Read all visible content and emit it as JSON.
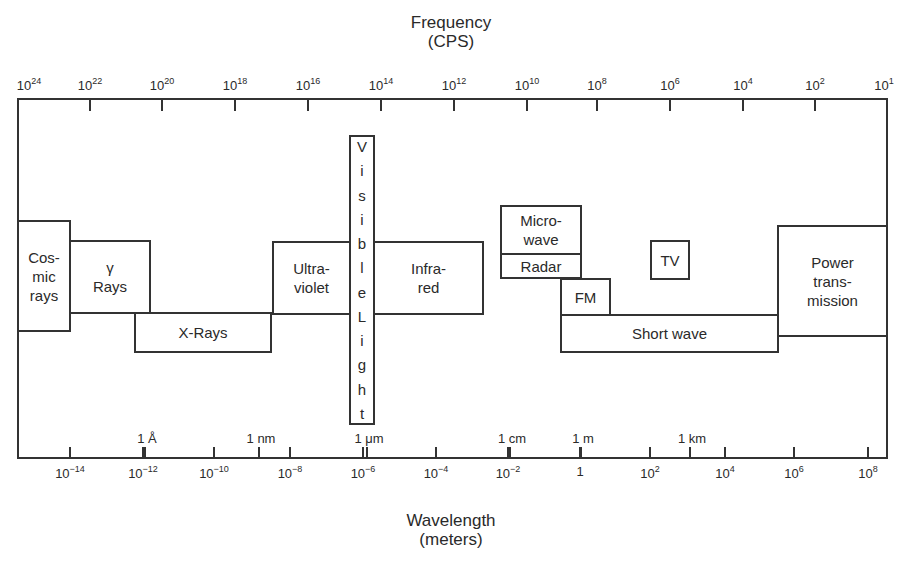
{
  "top_axis": {
    "title": "Frequency",
    "unit": "(CPS)",
    "ticks": [
      {
        "base": "10",
        "exp": "24",
        "x": 29
      },
      {
        "base": "10",
        "exp": "22",
        "x": 90
      },
      {
        "base": "10",
        "exp": "20",
        "x": 162
      },
      {
        "base": "10",
        "exp": "18",
        "x": 235
      },
      {
        "base": "10",
        "exp": "16",
        "x": 308
      },
      {
        "base": "10",
        "exp": "14",
        "x": 381
      },
      {
        "base": "10",
        "exp": "12",
        "x": 454
      },
      {
        "base": "10",
        "exp": "10",
        "x": 527
      },
      {
        "base": "10",
        "exp": "8",
        "x": 597
      },
      {
        "base": "10",
        "exp": "6",
        "x": 670
      },
      {
        "base": "10",
        "exp": "4",
        "x": 743
      },
      {
        "base": "10",
        "exp": "2",
        "x": 815
      },
      {
        "base": "10",
        "exp": "1",
        "x": 884
      }
    ]
  },
  "bottom_axis": {
    "title": "Wavelength",
    "unit": "(meters)",
    "ticks": [
      {
        "base": "10",
        "exp": "−14",
        "x": 70
      },
      {
        "base": "10",
        "exp": "−12",
        "x": 143
      },
      {
        "base": "10",
        "exp": "−10",
        "x": 214
      },
      {
        "base": "10",
        "exp": "−8",
        "x": 290
      },
      {
        "base": "10",
        "exp": "−6",
        "x": 363
      },
      {
        "base": "10",
        "exp": "−4",
        "x": 436
      },
      {
        "base": "10",
        "exp": "−2",
        "x": 508
      },
      {
        "base": "1",
        "exp": "",
        "x": 580
      },
      {
        "base": "10",
        "exp": "2",
        "x": 650
      },
      {
        "base": "10",
        "exp": "4",
        "x": 725
      },
      {
        "base": "10",
        "exp": "6",
        "x": 794
      },
      {
        "base": "10",
        "exp": "8",
        "x": 868
      }
    ],
    "unit_markers": [
      {
        "label": "1 Å",
        "x": 147
      },
      {
        "label": "1 nm",
        "x": 261
      },
      {
        "label": "1 μm",
        "x": 369
      },
      {
        "label": "1 cm",
        "x": 512
      },
      {
        "label": "1 m",
        "x": 583
      },
      {
        "label": "1 km",
        "x": 692
      }
    ]
  },
  "bands": [
    {
      "id": "cosmic-rays",
      "label": "Cos-\nmic\nrays",
      "x": 17,
      "y": 220,
      "w": 54,
      "h": 112
    },
    {
      "id": "gamma-rays",
      "label": "γ\nRays",
      "x": 69,
      "y": 240,
      "w": 82,
      "h": 74
    },
    {
      "id": "x-rays",
      "label": "X-Rays",
      "x": 134,
      "y": 312,
      "w": 138,
      "h": 41
    },
    {
      "id": "ultraviolet",
      "label": "Ultra-\nviolet",
      "x": 272,
      "y": 241,
      "w": 79,
      "h": 74
    },
    {
      "id": "infrared",
      "label": "Infra-\nred",
      "x": 373,
      "y": 241,
      "w": 111,
      "h": 74
    },
    {
      "id": "microwave",
      "label": "Micro-\nwave",
      "x": 500,
      "y": 205,
      "w": 82,
      "h": 50
    },
    {
      "id": "radar",
      "label": "Radar",
      "x": 500,
      "y": 253,
      "w": 82,
      "h": 26
    },
    {
      "id": "fm",
      "label": "FM",
      "x": 560,
      "y": 278,
      "w": 51,
      "h": 38
    },
    {
      "id": "tv",
      "label": "TV",
      "x": 650,
      "y": 240,
      "w": 40,
      "h": 40
    },
    {
      "id": "short-wave",
      "label": "Short wave",
      "x": 560,
      "y": 314,
      "w": 219,
      "h": 39
    },
    {
      "id": "power-transmission",
      "label": "Power\ntrans-\nmission",
      "x": 777,
      "y": 225,
      "w": 111,
      "h": 112
    }
  ],
  "visible_light": {
    "letters": [
      "V",
      "i",
      "s",
      "i",
      "b",
      "l",
      "e",
      "L",
      "i",
      "g",
      "h",
      "t"
    ],
    "x": 349,
    "y": 135,
    "w": 26,
    "h": 290
  }
}
